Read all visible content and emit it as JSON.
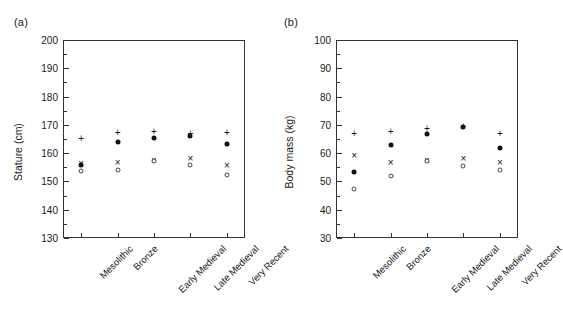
{
  "figure": {
    "panels": [
      {
        "label": "(a)",
        "ylabel": "Stature (cm)",
        "xlabel": ""
      },
      {
        "label": "(b)",
        "ylabel": "Body mass (kg)",
        "xlabel": ""
      }
    ]
  },
  "chart_data": [
    {
      "type": "scatter",
      "title": "(a)",
      "xlabel": "",
      "ylabel": "Stature (cm)",
      "categories": [
        "Mesolithic",
        "Bronze",
        "Early Medieval",
        "Late Medieval",
        "Very Recent"
      ],
      "ylim": [
        130,
        200
      ],
      "ytick_labels": [
        "130",
        "140",
        "150",
        "160",
        "170",
        "180",
        "190",
        "200"
      ],
      "yticks": [
        130,
        140,
        150,
        160,
        170,
        180,
        190,
        200
      ],
      "yminor_step": 5,
      "grid": false,
      "legend": "none",
      "series": [
        {
          "name": "plus",
          "marker": "+",
          "values": [
            164.9,
            167.2,
            167.3,
            166.8,
            167.0
          ]
        },
        {
          "name": "filled-circle",
          "marker": "●",
          "values": [
            155.8,
            163.9,
            165.2,
            166.1,
            163.3
          ]
        },
        {
          "name": "cross",
          "marker": "×",
          "values": [
            156.2,
            156.5,
            157.3,
            157.8,
            155.5
          ]
        },
        {
          "name": "open-circle",
          "marker": "○",
          "values": [
            153.6,
            154.1,
            157.2,
            155.8,
            152.1
          ]
        }
      ]
    },
    {
      "type": "scatter",
      "title": "(b)",
      "xlabel": "",
      "ylabel": "Body mass (kg)",
      "categories": [
        "Mesolithic",
        "Bronze",
        "Early Medieval",
        "Late Medieval",
        "Very Recent"
      ],
      "ylim": [
        30,
        100
      ],
      "ytick_labels": [
        "30",
        "40",
        "50",
        "60",
        "70",
        "80",
        "90",
        "100"
      ],
      "yticks": [
        30,
        40,
        50,
        60,
        70,
        80,
        90,
        100
      ],
      "yminor_step": 5,
      "grid": false,
      "legend": "none",
      "series": [
        {
          "name": "plus",
          "marker": "+",
          "values": [
            66.8,
            67.3,
            68.6,
            69.4,
            66.6
          ]
        },
        {
          "name": "filled-circle",
          "marker": "●",
          "values": [
            53.2,
            62.8,
            66.7,
            69.2,
            61.9
          ]
        },
        {
          "name": "cross",
          "marker": "×",
          "values": [
            59.0,
            56.4,
            57.3,
            58.0,
            56.4
          ]
        },
        {
          "name": "open-circle",
          "marker": "○",
          "values": [
            47.3,
            52.0,
            57.2,
            55.5,
            54.2
          ]
        }
      ]
    }
  ]
}
